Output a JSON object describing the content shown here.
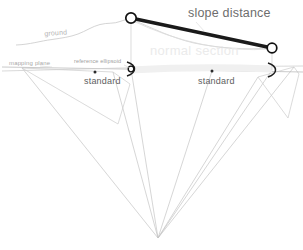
{
  "figure": {
    "canvas": {
      "width": 303,
      "height": 250,
      "background": "#ffffff"
    }
  },
  "labels": {
    "slope_distance": "slope distance",
    "ground": "ground",
    "mapping_plane": "mapping plane",
    "reference_ellipsoid": "reference ellipsoid",
    "standard_left": "standard",
    "standard_right": "standard",
    "normal_section": "normal section"
  },
  "colors": {
    "slope_line": "#1a1a1a",
    "slope_distance_text": "#6d6d6d",
    "ground_curve": "#c9c9c9",
    "ground_text": "#b4b4b4",
    "mapping_plane_line": "#b9b9b9",
    "mapping_plane_text": "#a8a8a8",
    "reference_ellipsoid_text": "#a0a0a0",
    "standard_text": "#5e5e5e",
    "normal_section_text": "#ebebeb",
    "fan_lines": "#c4c4c4",
    "wedge_outline": "#cccccc",
    "node_marker_stroke": "#111111",
    "node_marker_fill": "#ffffff",
    "station_dot": "#2b2b2b"
  },
  "nodes": {
    "ground_station_left": {
      "x": 131,
      "y": 18,
      "r": 5.2
    },
    "ground_station_right": {
      "x": 272,
      "y": 48,
      "r": 5.0
    },
    "ellipsoid_point_left": {
      "x": 131,
      "y": 69,
      "r": 3.2
    },
    "ellipsoid_point_right": {
      "x": 272,
      "y": 70,
      "r": 3.2
    },
    "earth_center": {
      "x": 158,
      "y": 238
    }
  },
  "dots": {
    "standard_left_dot": {
      "x": 95,
      "y": 72
    },
    "standard_right_dot": {
      "x": 212,
      "y": 71
    }
  },
  "geometry": {
    "slope_line": {
      "x1": 131,
      "y1": 18,
      "x2": 272,
      "y2": 48,
      "stroke_width": 3.4
    },
    "normal_section_curve": "M131,19 Q200,52 271,48",
    "ground_profile": "M16,45 C30,44 40,41 52,39 C62,37 70,36 78,34 C86,32 92,27 100,25 C108,23 114,24 120,22 C126,20 129,19 131,18",
    "ground_profile_right": "M131,19 C150,26 170,36 192,42 C215,48 245,50 272,48",
    "mapping_plane_line": {
      "x1": 2,
      "y1": 66,
      "x2": 303,
      "y2": 72
    },
    "ellipsoid_line": {
      "x1": 2,
      "y1": 70,
      "x2": 303,
      "y2": 66
    },
    "wedge_left": "M22,68 L113,72 L130,84 L118,124 Z",
    "wedge_right": "M258,77 L294,67 L299,74 L288,112 Z",
    "fan_rays": [
      {
        "x1": 22,
        "y1": 68,
        "x2": 158,
        "y2": 238
      },
      {
        "x1": 113,
        "y1": 72,
        "x2": 158,
        "y2": 238
      },
      {
        "x1": 131,
        "y1": 69,
        "x2": 158,
        "y2": 238
      },
      {
        "x1": 212,
        "y1": 71,
        "x2": 158,
        "y2": 238
      },
      {
        "x1": 258,
        "y1": 77,
        "x2": 158,
        "y2": 238
      },
      {
        "x1": 272,
        "y1": 70,
        "x2": 158,
        "y2": 238
      },
      {
        "x1": 294,
        "y1": 67,
        "x2": 158,
        "y2": 238
      }
    ],
    "vertical_drop_left": {
      "x1": 131,
      "y1": 18,
      "x2": 131,
      "y2": 69
    },
    "vertical_drop_right": {
      "x1": 272,
      "y1": 48,
      "x2": 272,
      "y2": 70
    },
    "angle_bracket_left": "M127,62 Q134,64 134,69 Q134,74 127,76",
    "angle_bracket_right": "M268,63 Q275,65 275,70 Q275,75 268,77"
  }
}
